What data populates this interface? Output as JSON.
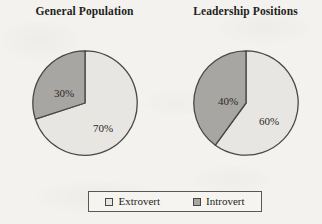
{
  "figure": {
    "legend": {
      "entries": [
        {
          "label": "Extrovert",
          "key": "extrovert",
          "color": "#e8e6e2",
          "swatch_icon": "square-swatch-icon"
        },
        {
          "label": "Introvert",
          "key": "introvert",
          "color": "#a8a6a3",
          "swatch_icon": "square-swatch-icon"
        }
      ]
    }
  },
  "colors": {
    "extrovert": "#e8e6e2",
    "introvert": "#a8a6a3",
    "outline": "#4a4744",
    "paper": "#f4f2ee",
    "text": "#231f1c"
  },
  "chart_data": [
    {
      "type": "pie",
      "title": "General Population",
      "categories": [
        "Extrovert",
        "Introvert"
      ],
      "values": [
        70,
        30
      ],
      "labels": [
        "70%",
        "40%"
      ],
      "slice_labels": [
        "70%",
        "30%"
      ],
      "unit": "percent",
      "start_angle_deg": 90,
      "direction": "counterclockwise-for-introvert",
      "legend_position": "bottom-center",
      "grid": false,
      "xlabel": "",
      "ylabel": ""
    },
    {
      "type": "pie",
      "title": "Leadership Positions",
      "categories": [
        "Extrovert",
        "Introvert"
      ],
      "values": [
        60,
        40
      ],
      "labels": [
        "60%",
        "40%"
      ],
      "slice_labels": [
        "60%",
        "40%"
      ],
      "unit": "percent",
      "start_angle_deg": 90,
      "direction": "counterclockwise-for-introvert",
      "legend_position": "bottom-center",
      "grid": false,
      "xlabel": "",
      "ylabel": ""
    }
  ]
}
